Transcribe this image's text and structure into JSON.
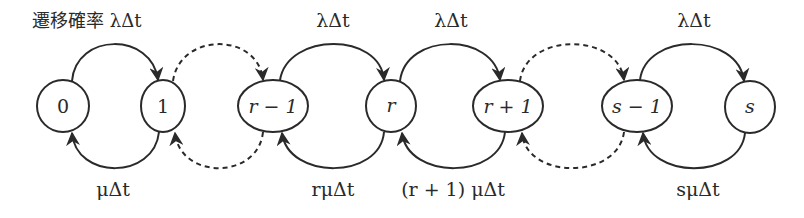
{
  "diagram": {
    "caption": "遷移確率 λΔt",
    "nodes": [
      {
        "id": "0",
        "label": "0",
        "cx": 63,
        "cy": 106,
        "rx": 26,
        "ry": 26,
        "italic": false
      },
      {
        "id": "1",
        "label": "1",
        "cx": 163,
        "cy": 106,
        "rx": 22,
        "ry": 26,
        "italic": false
      },
      {
        "id": "r-1",
        "label": "r − 1",
        "cx": 273,
        "cy": 106,
        "rx": 35,
        "ry": 26,
        "italic": true
      },
      {
        "id": "r",
        "label": "r",
        "cx": 391,
        "cy": 106,
        "rx": 25,
        "ry": 26,
        "italic": true
      },
      {
        "id": "r+1",
        "label": "r + 1",
        "cx": 508,
        "cy": 106,
        "rx": 35,
        "ry": 26,
        "italic": true
      },
      {
        "id": "s-1",
        "label": "s − 1",
        "cx": 637,
        "cy": 106,
        "rx": 35,
        "ry": 26,
        "italic": true
      },
      {
        "id": "s",
        "label": "s",
        "cx": 750,
        "cy": 107,
        "rx": 25,
        "ry": 26,
        "italic": true
      }
    ],
    "forward_labels": {
      "r_minus_1_to_r": "λΔt",
      "r_to_r_plus_1": "λΔt",
      "s_minus_1_to_s": "λΔt"
    },
    "backward_labels": {
      "1_to_0": "μΔt",
      "r_to_r_minus_1": "rμΔt",
      "r_plus_1_to_r": "(r + 1) μΔt",
      "s_to_s_minus_1": "sμΔt"
    },
    "edges": [
      {
        "from": "0",
        "to": "1",
        "direction": "forward",
        "style": "solid"
      },
      {
        "from": "1",
        "to": "0",
        "direction": "backward",
        "style": "solid"
      },
      {
        "from": "1",
        "to": "r-1",
        "direction": "forward",
        "style": "dashed"
      },
      {
        "from": "r-1",
        "to": "1",
        "direction": "backward",
        "style": "dashed"
      },
      {
        "from": "r-1",
        "to": "r",
        "direction": "forward",
        "style": "solid"
      },
      {
        "from": "r",
        "to": "r-1",
        "direction": "backward",
        "style": "solid"
      },
      {
        "from": "r",
        "to": "r+1",
        "direction": "forward",
        "style": "solid"
      },
      {
        "from": "r+1",
        "to": "r",
        "direction": "backward",
        "style": "solid"
      },
      {
        "from": "r+1",
        "to": "s-1",
        "direction": "forward",
        "style": "dashed"
      },
      {
        "from": "s-1",
        "to": "r+1",
        "direction": "backward",
        "style": "dashed"
      },
      {
        "from": "s-1",
        "to": "s",
        "direction": "forward",
        "style": "solid"
      },
      {
        "from": "s",
        "to": "s-1",
        "direction": "backward",
        "style": "solid"
      }
    ],
    "colors": {
      "stroke": "#2a2a2a",
      "background": "#ffffff"
    }
  }
}
